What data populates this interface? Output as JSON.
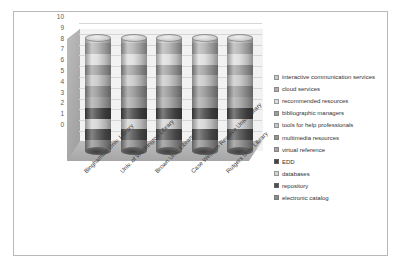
{
  "chart_data": {
    "type": "bar",
    "subtype": "stacked-cylinder-3d",
    "title": "",
    "xlabel": "",
    "ylabel": "",
    "ylim": [
      0,
      10
    ],
    "yticks": [
      0,
      1,
      2,
      3,
      4,
      5,
      6,
      7,
      8,
      9,
      10
    ],
    "grid": true,
    "legend_position": "right",
    "categories": [
      "Binghamton Univ. Library",
      "Univ. of Washington Library",
      "Brown Univ. Library",
      "Case Western Reserve Univ. Library",
      "Rutgers Univ. Library"
    ],
    "series": [
      {
        "name": "electronic catalog",
        "color": "#8c8c8c",
        "values": [
          1,
          1,
          1,
          1,
          1
        ]
      },
      {
        "name": "repository",
        "color": "#4f4f4f",
        "values": [
          1,
          1,
          1,
          1,
          1
        ]
      },
      {
        "name": "databases",
        "color": "#d2d2d2",
        "values": [
          1,
          1,
          1,
          1,
          1
        ]
      },
      {
        "name": "EDD",
        "color": "#454545",
        "values": [
          1,
          1,
          1,
          1,
          1
        ]
      },
      {
        "name": "virtual reference",
        "color": "#a5a5a5",
        "values": [
          1,
          1,
          1,
          1,
          1
        ]
      },
      {
        "name": "multimedia resources",
        "color": "#949494",
        "values": [
          1,
          1,
          1,
          1,
          1
        ]
      },
      {
        "name": "tools for help professionals",
        "color": "#c6c6c6",
        "values": [
          1,
          1,
          1,
          1,
          1
        ]
      },
      {
        "name": "bibliographic managers",
        "color": "#9d9d9d",
        "values": [
          1,
          1,
          1,
          1,
          1
        ]
      },
      {
        "name": "recommended resources",
        "color": "#dcdcdc",
        "values": [
          1,
          1,
          1,
          1,
          1
        ]
      },
      {
        "name": "cloud services",
        "color": "#b0b0b0",
        "values": [
          1,
          1,
          1,
          1,
          1
        ]
      },
      {
        "name": "interactive communication services",
        "color": "#c9c9c9",
        "values": [
          0.5,
          0.5,
          0.5,
          0.5,
          0.5
        ]
      }
    ]
  },
  "legend": {
    "items": [
      {
        "label": "interactive communication services",
        "color": "#c9c9c9"
      },
      {
        "label": "cloud services",
        "color": "#b0b0b0"
      },
      {
        "label": "recommended resources",
        "color": "#dcdcdc"
      },
      {
        "label": "bibliographic managers",
        "color": "#9d9d9d"
      },
      {
        "label": "tools for help professionals",
        "color": "#c6c6c6"
      },
      {
        "label": "multimedia resources",
        "color": "#949494"
      },
      {
        "label": "virtual reference",
        "color": "#a5a5a5"
      },
      {
        "label": "EDD",
        "color": "#454545"
      },
      {
        "label": "databases",
        "color": "#d2d2d2"
      },
      {
        "label": "repository",
        "color": "#4f4f4f"
      },
      {
        "label": "electronic catalog",
        "color": "#8c8c8c"
      }
    ]
  }
}
